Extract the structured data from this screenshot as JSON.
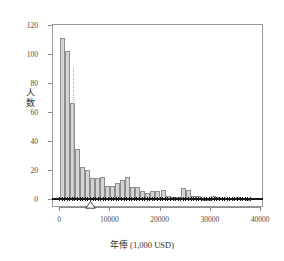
{
  "figure": {
    "faint_header": "",
    "bar_fill": "#d4d4d4",
    "bar_stroke": "#8d8d8d",
    "frame_color": "#9a9a9a",
    "rug_color": "#161616",
    "mean_line_color": "#a9a9a9"
  },
  "chart_data": {
    "type": "bar",
    "title": "",
    "xlabel": "年俸 (1,000 USD)",
    "xlabel_main": "年俸",
    "xlabel_unit": "(1,000 USD)",
    "ylabel": "人数",
    "ylabel_chars": [
      "人",
      "数"
    ],
    "xlim": [
      0,
      40000
    ],
    "ylim": [
      0,
      120
    ],
    "xticks": [
      0,
      10000,
      20000,
      30000,
      40000
    ],
    "xtick_labels": [
      "0",
      "10000",
      "20000",
      "30000",
      "40000"
    ],
    "yticks": [
      0,
      20,
      40,
      60,
      80,
      100,
      120
    ],
    "ytick_labels": [
      "0",
      "20",
      "40",
      "60",
      "80",
      "100",
      "120"
    ],
    "grid": false,
    "legend": null,
    "bin_width": 1000,
    "bin_starts": [
      0,
      1000,
      2000,
      3000,
      4000,
      5000,
      6000,
      7000,
      8000,
      9000,
      10000,
      11000,
      12000,
      13000,
      14000,
      15000,
      16000,
      17000,
      18000,
      19000,
      20000,
      21000,
      22000,
      23000,
      24000,
      25000,
      26000,
      27000,
      28000,
      29000,
      30000,
      31000,
      32000,
      33000,
      34000,
      35000,
      36000,
      37000,
      38000,
      39000
    ],
    "values": [
      112,
      103,
      67,
      35,
      23,
      21,
      15,
      15,
      16,
      10,
      10,
      12,
      14,
      16,
      9,
      9,
      6,
      5,
      6,
      6,
      7,
      3,
      2,
      2,
      8,
      7,
      3,
      3,
      1,
      1,
      3,
      2,
      0,
      0,
      0,
      2,
      0,
      1,
      0,
      0
    ],
    "annotations": [
      {
        "name": "mean-line",
        "type": "vline",
        "x": 2600,
        "style": "dotted",
        "y_top": 92
      },
      {
        "name": "median-marker",
        "type": "triangle",
        "x": 6300
      }
    ],
    "rug": {
      "name": "rug-plot",
      "x_min": 0,
      "x_max": 38000,
      "count": 75
    }
  }
}
